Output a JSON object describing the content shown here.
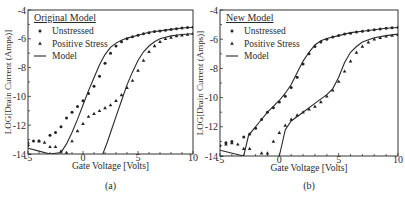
{
  "figure": {
    "panels": [
      "(a)",
      "(b)"
    ]
  },
  "chart_data": [
    {
      "type": "scatter",
      "panel_label": "(a)",
      "legend_title": "Original Model",
      "legend": [
        {
          "label": "Unstressed",
          "marker": "circle"
        },
        {
          "label": "Positive Stress",
          "marker": "triangle"
        },
        {
          "label": "Model",
          "marker": "line"
        }
      ],
      "xlabel": "Gate Voltage [Volts]",
      "ylabel": "LOG[Drain Current (Amps)]",
      "xlim": [
        -5,
        10
      ],
      "ylim": [
        -14,
        -4
      ],
      "xticks": [
        -5,
        0,
        5,
        10
      ],
      "yticks": [
        -4,
        -6,
        -8,
        -10,
        -12,
        -14
      ],
      "grid": false,
      "frame": {
        "x0": 28,
        "x1": 193,
        "y0": 10,
        "y1": 154
      },
      "series": [
        {
          "name": "Unstressed",
          "marker": "circle",
          "x": [
            -5,
            -4.5,
            -4,
            -3,
            -2.5,
            -2,
            -1.5,
            -1,
            -0.5,
            0,
            0.5,
            1,
            1.5,
            2,
            2.5,
            3,
            3.5,
            4,
            4.5,
            5,
            5.5,
            6,
            6.5,
            7,
            7.5,
            8,
            8.5,
            9,
            9.5,
            10
          ],
          "y": [
            -13.4,
            -13.1,
            -13.1,
            -12.7,
            -12.5,
            -12.1,
            -11.5,
            -11.1,
            -10.7,
            -10.3,
            -9.8,
            -9.3,
            -8.6,
            -7.7,
            -7.0,
            -6.5,
            -6.2,
            -6.0,
            -5.85,
            -5.75,
            -5.65,
            -5.58,
            -5.5,
            -5.45,
            -5.4,
            -5.35,
            -5.3,
            -5.25,
            -5.22,
            -5.2
          ]
        },
        {
          "name": "Positive Stress",
          "marker": "triangle",
          "x": [
            -5,
            -4,
            -3.5,
            -3,
            -2.5,
            -2,
            -1.5,
            -1,
            -0.5,
            0,
            0.5,
            1,
            1.5,
            2,
            2.5,
            3,
            3.5,
            4,
            4.5,
            5,
            5.5,
            6,
            6.5,
            7,
            7.5,
            8,
            8.5,
            9,
            9.5,
            10
          ],
          "y": [
            -13.2,
            -13.1,
            -13.2,
            -13.5,
            -13.5,
            -13.8,
            -13.9,
            -13.1,
            -12.4,
            -11.9,
            -11.4,
            -11.2,
            -11.0,
            -10.8,
            -10.6,
            -10.3,
            -9.9,
            -9.4,
            -8.9,
            -8.2,
            -7.5,
            -6.9,
            -6.5,
            -6.2,
            -6.0,
            -5.9,
            -5.8,
            -5.75,
            -5.7,
            -5.65
          ]
        },
        {
          "name": "Model (Unstressed)",
          "marker": "line",
          "x": [
            -5,
            -4,
            -3,
            -2,
            -1.5,
            -1,
            -0.5,
            0,
            0.5,
            1,
            1.5,
            2,
            2.5,
            3,
            3.5,
            4,
            5,
            6,
            7,
            8,
            9,
            10
          ],
          "y": [
            -13.6,
            -13.8,
            -14.0,
            -13.9,
            -13.3,
            -12.5,
            -11.6,
            -10.6,
            -9.6,
            -8.7,
            -7.8,
            -7.1,
            -6.6,
            -6.3,
            -6.1,
            -5.95,
            -5.75,
            -5.55,
            -5.45,
            -5.35,
            -5.25,
            -5.2
          ]
        },
        {
          "name": "Model (Positive Stress)",
          "marker": "line",
          "x": [
            1.8,
            2.2,
            2.6,
            3,
            3.5,
            4,
            4.5,
            5,
            5.5,
            6,
            6.5,
            7,
            8,
            9,
            10
          ],
          "y": [
            -14,
            -13.2,
            -12.3,
            -11.4,
            -10.3,
            -9.2,
            -8.3,
            -7.5,
            -6.9,
            -6.5,
            -6.2,
            -6.0,
            -5.8,
            -5.7,
            -5.65
          ]
        }
      ]
    },
    {
      "type": "scatter",
      "panel_label": "(b)",
      "legend_title": "New Model",
      "legend": [
        {
          "label": "Unstressed",
          "marker": "circle"
        },
        {
          "label": "Positive Stress",
          "marker": "triangle"
        },
        {
          "label": "Model",
          "marker": "line"
        }
      ],
      "xlabel": "Gate Voltage [Volts]",
      "ylabel": "LOG[Drain Current (Amps)]",
      "xlim": [
        -5,
        10
      ],
      "ylim": [
        -14,
        -4
      ],
      "xticks": [
        -5,
        0,
        5,
        10
      ],
      "yticks": [
        -4,
        -6,
        -8,
        -10,
        -12,
        -14
      ],
      "grid": false,
      "frame": {
        "x0": 220,
        "x1": 398,
        "y0": 10,
        "y1": 156
      },
      "series": [
        {
          "name": "Unstressed",
          "marker": "circle",
          "x": [
            -5,
            -4.5,
            -4,
            -3,
            -2.5,
            -2,
            -1.5,
            -1,
            -0.5,
            0,
            0.5,
            1,
            1.5,
            2,
            2.5,
            3,
            3.5,
            4,
            4.5,
            5,
            5.5,
            6,
            6.5,
            7,
            7.5,
            8,
            8.5,
            9,
            9.5,
            10
          ],
          "y": [
            -13.3,
            -13.1,
            -13.0,
            -12.7,
            -12.5,
            -12.1,
            -11.5,
            -11.0,
            -10.7,
            -10.3,
            -9.9,
            -9.3,
            -8.6,
            -7.7,
            -7.0,
            -6.5,
            -6.2,
            -6.0,
            -5.85,
            -5.75,
            -5.65,
            -5.6,
            -5.5,
            -5.45,
            -5.4,
            -5.35,
            -5.3,
            -5.25,
            -5.22,
            -5.2
          ]
        },
        {
          "name": "Positive Stress",
          "marker": "triangle",
          "x": [
            -4.5,
            -4,
            -3.5,
            -3,
            -2.5,
            -1.5,
            -1,
            -0.5,
            0,
            0.5,
            1,
            1.5,
            2,
            2.5,
            3,
            3.5,
            4,
            4.5,
            5,
            5.5,
            6,
            6.5,
            7,
            7.5,
            8,
            8.5,
            9,
            9.5,
            10
          ],
          "y": [
            -13.2,
            -13.1,
            -13.2,
            -13.5,
            -13.5,
            -13.8,
            -13.8,
            -13.0,
            -12.4,
            -11.9,
            -11.5,
            -11.2,
            -11.0,
            -10.8,
            -10.6,
            -10.3,
            -9.9,
            -9.5,
            -8.9,
            -8.2,
            -7.5,
            -6.9,
            -6.5,
            -6.2,
            -6.0,
            -5.9,
            -5.8,
            -5.75,
            -5.7
          ]
        },
        {
          "name": "Model (Unstressed)",
          "marker": "line",
          "x": [
            -5,
            -3,
            -2.6,
            -2.2,
            -1.5,
            -1,
            0,
            0.5,
            1,
            1.5,
            2,
            2.5,
            3,
            3.5,
            4,
            5,
            6,
            7,
            8,
            9,
            10
          ],
          "y": [
            -13.6,
            -14.0,
            -12.6,
            -12.2,
            -11.5,
            -11.0,
            -10.2,
            -9.7,
            -9.1,
            -8.3,
            -7.5,
            -6.9,
            -6.4,
            -6.1,
            -5.95,
            -5.75,
            -5.55,
            -5.45,
            -5.35,
            -5.25,
            -5.2
          ]
        },
        {
          "name": "Model (Positive Stress)",
          "marker": "line",
          "x": [
            0,
            0.5,
            1,
            2,
            3,
            4,
            4.5,
            5,
            5.5,
            6,
            6.5,
            7,
            8,
            9,
            10
          ],
          "y": [
            -14.0,
            -12.2,
            -11.6,
            -11.0,
            -10.4,
            -9.8,
            -9.4,
            -8.6,
            -7.6,
            -6.9,
            -6.5,
            -6.2,
            -5.9,
            -5.75,
            -5.65
          ]
        }
      ]
    }
  ]
}
